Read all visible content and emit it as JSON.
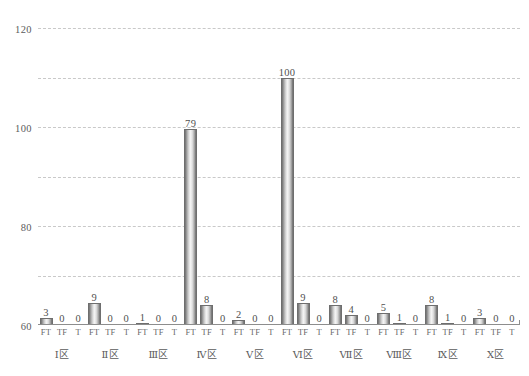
{
  "chart_data": {
    "type": "bar",
    "title": "",
    "subtitle": "",
    "xlabel": "",
    "ylabel": "",
    "ylim": [
      0,
      120
    ],
    "yticks": [
      0,
      20,
      40,
      60,
      80,
      100,
      120
    ],
    "ytick_labels": [
      "0",
      "20",
      "40",
      "60",
      "80",
      "100",
      "120"
    ],
    "grid": true,
    "legend": "none",
    "categories": [
      "I区",
      "II区",
      "III区",
      "IV区",
      "V区",
      "VI区",
      "VII区",
      "VIII区",
      "IX区",
      "X区"
    ],
    "category_display": [
      "Ⅰ区",
      "Ⅱ区",
      "Ⅲ区",
      "Ⅳ区",
      "Ⅴ区",
      "Ⅵ区",
      "Ⅶ区",
      "Ⅷ区",
      "Ⅸ区",
      "Ⅹ区"
    ],
    "subcategories": [
      "FT",
      "TF",
      "T"
    ],
    "series": [
      {
        "name": "FT",
        "values": [
          3,
          9,
          1,
          79,
          2,
          100,
          8,
          5,
          8,
          3
        ]
      },
      {
        "name": "TF",
        "values": [
          0,
          0,
          0,
          8,
          0,
          9,
          4,
          1,
          1,
          0
        ]
      },
      {
        "name": "T",
        "values": [
          0,
          0,
          0,
          0,
          0,
          0,
          0,
          0,
          0,
          0
        ]
      }
    ],
    "bar_labels": [
      [
        "3",
        "0",
        "0"
      ],
      [
        "9",
        "0",
        "0"
      ],
      [
        "1",
        "0",
        "0"
      ],
      [
        "79",
        "8",
        "0"
      ],
      [
        "2",
        "0",
        "0"
      ],
      [
        "100",
        "9",
        "0"
      ],
      [
        "8",
        "4",
        "0"
      ],
      [
        "5",
        "1",
        "0"
      ],
      [
        "8",
        "1",
        "0"
      ],
      [
        "3",
        "0",
        "0"
      ]
    ],
    "colors": {
      "bar_light": "#f4f4f4",
      "bar_dark": "#6b6b6b",
      "bar_border": "#6e6e6e",
      "gridline": "#c9c9c9",
      "axis": "#8d8d8d",
      "text": "#5b5b5b",
      "background": "#ffffff"
    }
  }
}
